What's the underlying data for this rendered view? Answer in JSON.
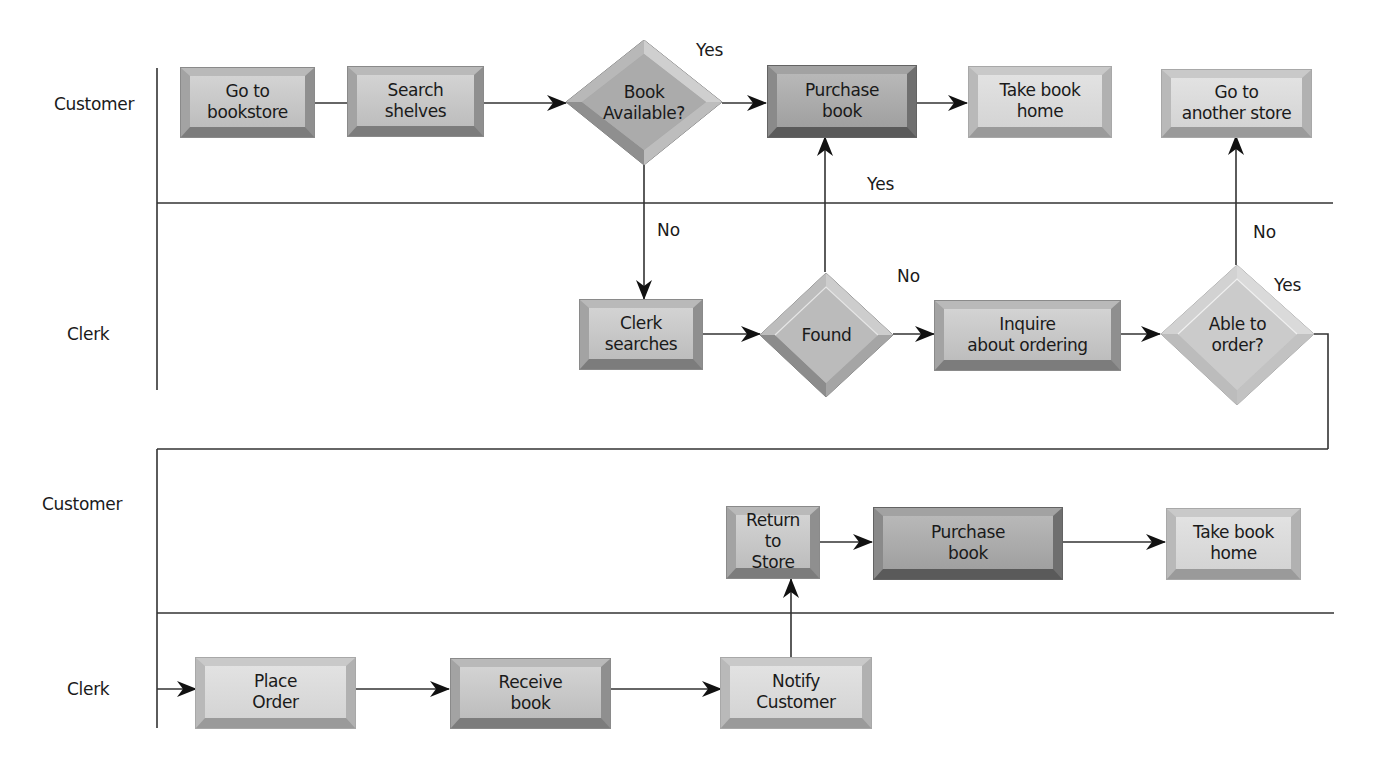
{
  "diagram": {
    "type": "swimlane-flowchart",
    "lanes": [
      {
        "id": "lane1",
        "label": "Customer"
      },
      {
        "id": "lane2",
        "label": "Clerk"
      },
      {
        "id": "lane3",
        "label": "Customer"
      },
      {
        "id": "lane4",
        "label": "Clerk"
      }
    ],
    "nodes": {
      "go_to_bookstore": {
        "label": "Go to\nbookstore",
        "shape": "rectangle",
        "lane": "Customer"
      },
      "search_shelves": {
        "label": "Search\nshelves",
        "shape": "rectangle",
        "lane": "Customer"
      },
      "book_available": {
        "label": "Book\nAvailable?",
        "shape": "decision",
        "lane": "Customer"
      },
      "purchase_book_1": {
        "label": "Purchase\nbook",
        "shape": "rectangle",
        "lane": "Customer"
      },
      "take_book_home_1": {
        "label": "Take book\nhome",
        "shape": "rectangle",
        "lane": "Customer"
      },
      "go_to_another_store": {
        "label": "Go to\nanother store",
        "shape": "rectangle",
        "lane": "Customer"
      },
      "clerk_searches": {
        "label": "Clerk\nsearches",
        "shape": "rectangle",
        "lane": "Clerk"
      },
      "found": {
        "label": "Found",
        "shape": "decision",
        "lane": "Clerk"
      },
      "inquire_about_ordering": {
        "label": "Inquire\nabout ordering",
        "shape": "rectangle",
        "lane": "Clerk"
      },
      "able_to_order": {
        "label": "Able to\norder?",
        "shape": "decision",
        "lane": "Clerk"
      },
      "return_to_store": {
        "label": "Return to\nStore",
        "shape": "rectangle",
        "lane": "Customer"
      },
      "purchase_book_2": {
        "label": "Purchase\nbook",
        "shape": "rectangle",
        "lane": "Customer"
      },
      "take_book_home_2": {
        "label": "Take book\nhome",
        "shape": "rectangle",
        "lane": "Customer"
      },
      "place_order": {
        "label": "Place\nOrder",
        "shape": "rectangle",
        "lane": "Clerk"
      },
      "receive_book": {
        "label": "Receive\nbook",
        "shape": "rectangle",
        "lane": "Clerk"
      },
      "notify_customer": {
        "label": "Notify\nCustomer",
        "shape": "rectangle",
        "lane": "Clerk"
      }
    },
    "edge_labels": {
      "book_available_yes": "Yes",
      "book_available_no": "No",
      "found_yes": "Yes",
      "found_no": "No",
      "able_to_order_no": "No",
      "able_to_order_yes": "Yes"
    },
    "edges": [
      {
        "from": "go_to_bookstore",
        "to": "search_shelves"
      },
      {
        "from": "search_shelves",
        "to": "book_available"
      },
      {
        "from": "book_available",
        "to": "purchase_book_1",
        "label": "Yes"
      },
      {
        "from": "book_available",
        "to": "clerk_searches",
        "label": "No"
      },
      {
        "from": "purchase_book_1",
        "to": "take_book_home_1"
      },
      {
        "from": "clerk_searches",
        "to": "found"
      },
      {
        "from": "found",
        "to": "purchase_book_1",
        "label": "Yes"
      },
      {
        "from": "found",
        "to": "inquire_about_ordering",
        "label": "No"
      },
      {
        "from": "inquire_about_ordering",
        "to": "able_to_order"
      },
      {
        "from": "able_to_order",
        "to": "go_to_another_store",
        "label": "No"
      },
      {
        "from": "able_to_order",
        "to": "place_order",
        "label": "Yes"
      },
      {
        "from": "place_order",
        "to": "receive_book"
      },
      {
        "from": "receive_book",
        "to": "notify_customer"
      },
      {
        "from": "notify_customer",
        "to": "return_to_store"
      },
      {
        "from": "return_to_store",
        "to": "purchase_book_2"
      },
      {
        "from": "purchase_book_2",
        "to": "take_book_home_2"
      }
    ]
  }
}
